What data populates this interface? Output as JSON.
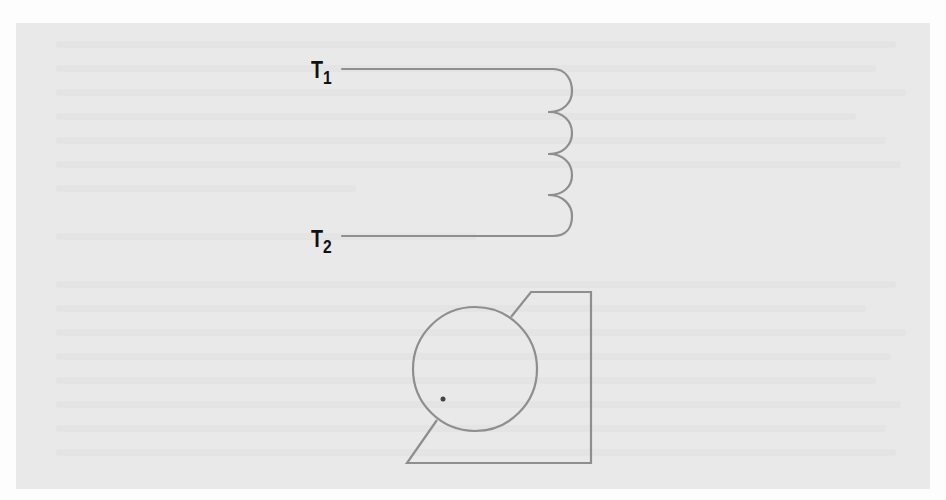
{
  "figure": {
    "colors": {
      "page_background": "#fdfdfd",
      "panel_background": "#e9e9e9",
      "stroke": "#8e8e8e",
      "label_text": "#111111",
      "dot": "#444444"
    },
    "coil": {
      "name": "inductor-coil",
      "loops": 4,
      "terminals": [
        {
          "id": "T1",
          "label_main": "T",
          "label_sub": "1"
        },
        {
          "id": "T2",
          "label_main": "T",
          "label_sub": "2"
        }
      ]
    },
    "motor_symbol": {
      "name": "motor-symbol",
      "circle": {
        "cx": 475,
        "cy": 369,
        "r": 62
      },
      "dot": {
        "cx": 443,
        "cy": 399,
        "r": 2.5
      }
    }
  }
}
